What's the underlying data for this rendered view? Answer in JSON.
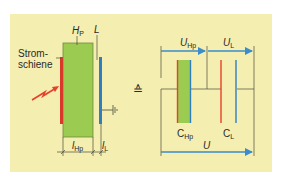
{
  "labels": {
    "hp": {
      "main": "H",
      "sub": "P"
    },
    "l": {
      "main": "L"
    },
    "strom": [
      "Strom-",
      "schiene"
    ],
    "lhp": {
      "main": "l",
      "sub": "Hp"
    },
    "ll": {
      "main": "l",
      "sub": "L"
    },
    "equiv": "≙",
    "uhp": {
      "main": "U",
      "sub": "Hp"
    },
    "ul": {
      "main": "U",
      "sub": "L"
    },
    "chp": {
      "main": "C",
      "sub": "Hp"
    },
    "cl": {
      "main": "C",
      "sub": "L"
    },
    "u": {
      "main": "U"
    }
  },
  "colors": {
    "background": "#f4eeb0",
    "insulation": "#9ccb52",
    "busbar": "#e8402a",
    "conductor": "#2f7fc0",
    "arrow": "#3a8ccc",
    "line": "#4a4a3a"
  }
}
